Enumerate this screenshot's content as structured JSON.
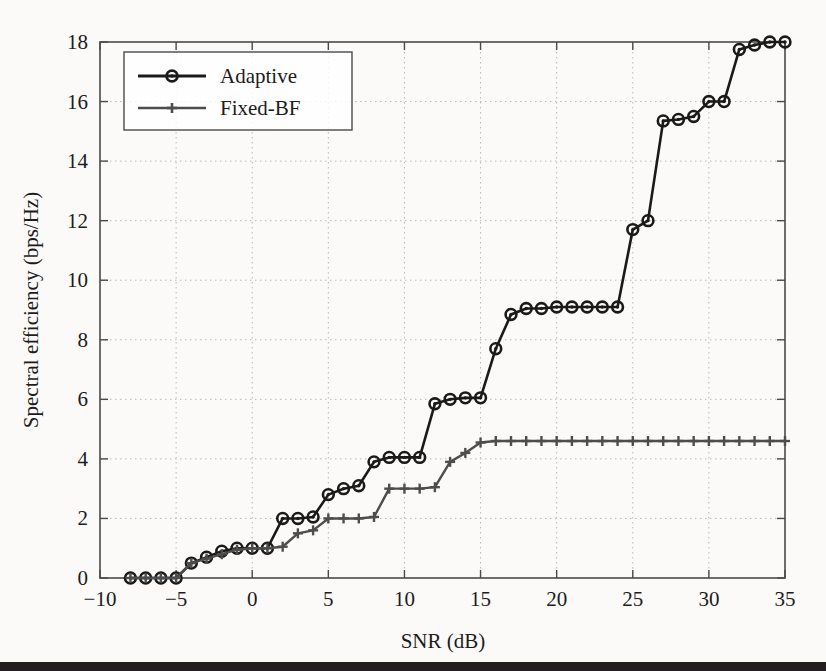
{
  "chart_data": {
    "type": "line",
    "title": "",
    "xlabel": "SNR (dB)",
    "ylabel": "Spectral efficiency (bps/Hz)",
    "xlim": [
      -10,
      35
    ],
    "ylim": [
      0,
      18
    ],
    "xticks": [
      -10,
      -5,
      0,
      5,
      10,
      15,
      20,
      25,
      30,
      35
    ],
    "xticklabels": [
      "−10",
      "−5",
      "0",
      "5",
      "10",
      "15",
      "20",
      "25",
      "30",
      "35"
    ],
    "yticks": [
      0,
      2,
      4,
      6,
      8,
      10,
      12,
      14,
      16,
      18
    ],
    "yticklabels": [
      "0",
      "2",
      "4",
      "6",
      "8",
      "10",
      "12",
      "14",
      "16",
      "18"
    ],
    "grid": true,
    "grid_style": "dotted",
    "legend_position": "top-left",
    "x": [
      -8,
      -7,
      -6,
      -5,
      -4,
      -3,
      -2,
      -1,
      0,
      1,
      2,
      3,
      4,
      5,
      6,
      7,
      8,
      9,
      10,
      11,
      12,
      13,
      14,
      15,
      16,
      17,
      18,
      19,
      20,
      21,
      22,
      23,
      24,
      25,
      26,
      27,
      28,
      29,
      30,
      31,
      32,
      33,
      34,
      35
    ],
    "series": [
      {
        "name": "Adaptive",
        "marker": "circle",
        "color": "#1a1a1a",
        "values": [
          0,
          0,
          0,
          0,
          0.5,
          0.7,
          0.9,
          1.0,
          1.0,
          1.0,
          2.0,
          2.0,
          2.05,
          2.8,
          3.0,
          3.1,
          3.9,
          4.05,
          4.05,
          4.05,
          5.85,
          6.0,
          6.05,
          6.05,
          7.7,
          8.85,
          9.05,
          9.05,
          9.1,
          9.1,
          9.1,
          9.1,
          9.1,
          11.7,
          12.0,
          15.35,
          15.4,
          15.5,
          16.0,
          16.0,
          17.75,
          17.9,
          18.0,
          18.0
        ]
      },
      {
        "name": "Fixed-BF",
        "marker": "plus",
        "color": "#4d4d4d",
        "values": [
          0,
          0,
          0,
          0,
          0.5,
          0.65,
          0.8,
          0.95,
          1.0,
          1.0,
          1.05,
          1.5,
          1.6,
          2.0,
          2.0,
          2.0,
          2.05,
          3.0,
          3.0,
          3.0,
          3.05,
          3.9,
          4.2,
          4.55,
          4.6,
          4.6,
          4.6,
          4.6,
          4.6,
          4.6,
          4.6,
          4.6,
          4.6,
          4.6,
          4.6,
          4.6,
          4.6,
          4.6,
          4.6,
          4.6,
          4.6,
          4.6,
          4.6,
          4.6
        ]
      }
    ]
  },
  "legend": {
    "entries": [
      {
        "label": "Adaptive"
      },
      {
        "label": "Fixed-BF"
      }
    ]
  }
}
